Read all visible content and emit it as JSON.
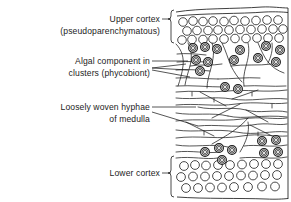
{
  "figure": {
    "background_color": "#ffffff",
    "ink_color": "#1d1d1d",
    "width": 291,
    "height": 202
  },
  "labels": [
    {
      "id": "upper-cortex",
      "line1": "Upper cortex",
      "line2": "(pseudoparenchymatous)",
      "anchor": "end",
      "x": 160,
      "y1": 22,
      "y2": 34,
      "marker": "bracket"
    },
    {
      "id": "algal-component",
      "line1": "Algal component in",
      "line2": "clusters (phycobiont)",
      "anchor": "end",
      "x": 150,
      "y1": 64,
      "y2": 76,
      "marker": "leader-fan"
    },
    {
      "id": "medulla-hyphae",
      "line1": "Loosely woven hyphae",
      "line2": "of medulla",
      "anchor": "end",
      "x": 150,
      "y1": 110,
      "y2": 122,
      "marker": "leader-pair"
    },
    {
      "id": "lower-cortex",
      "line1": "Lower cortex",
      "line2": "",
      "anchor": "end",
      "x": 160,
      "y1": 176,
      "y2": 0,
      "marker": "bracket"
    }
  ],
  "brackets": [
    {
      "id": "upper-cortex-bracket",
      "x": 171,
      "y_top": 10,
      "y_bottom": 43,
      "tick_x": 162,
      "tick_y": 26
    },
    {
      "id": "lower-cortex-bracket",
      "x": 171,
      "y_top": 156,
      "y_bottom": 197,
      "tick_x": 162,
      "tick_y": 176
    }
  ],
  "layers": [
    {
      "id": "upper-cortex-layer",
      "name": "Upper cortex",
      "structure": "pseudoparenchymatous",
      "cell_shape": "circle",
      "rows": 3,
      "cells_per_row": [
        10,
        9,
        10
      ],
      "y_start": 18,
      "row_spacing": 9.5,
      "cell_radius": 4.3,
      "x_start": 180,
      "x_spacing": 10.2
    },
    {
      "id": "algal-layer",
      "name": "Algal component in clusters (phycobiont)",
      "cell_shape": "concentric-circle",
      "cell_count": 16,
      "cell_radius": 4.4
    },
    {
      "id": "medulla-layer",
      "name": "Loosely woven hyphae of medulla",
      "structure": "loosely woven hyphae",
      "strand_count": 26
    },
    {
      "id": "lower-cortex-layer",
      "name": "Lower cortex",
      "cell_shape": "circle",
      "rows": 3,
      "cells_per_row": [
        9,
        9,
        8
      ],
      "y_start": 164,
      "row_spacing": 10.5,
      "cell_radius": 4.4,
      "x_start": 181,
      "x_spacing": 11.0
    }
  ],
  "algal_cells": [
    {
      "cx": 193,
      "cy": 48
    },
    {
      "cx": 205,
      "cy": 47
    },
    {
      "cx": 217,
      "cy": 49
    },
    {
      "cx": 240,
      "cy": 50
    },
    {
      "cx": 266,
      "cy": 46
    },
    {
      "cx": 280,
      "cy": 50
    },
    {
      "cx": 196,
      "cy": 60
    },
    {
      "cx": 208,
      "cy": 62
    },
    {
      "cx": 234,
      "cy": 60
    },
    {
      "cx": 258,
      "cy": 58
    },
    {
      "cx": 276,
      "cy": 62
    },
    {
      "cx": 200,
      "cy": 71
    },
    {
      "cx": 225,
      "cy": 87
    },
    {
      "cx": 238,
      "cy": 89
    },
    {
      "cx": 205,
      "cy": 152
    },
    {
      "cx": 219,
      "cy": 148
    },
    {
      "cx": 232,
      "cy": 150
    },
    {
      "cx": 222,
      "cy": 160
    },
    {
      "cx": 262,
      "cy": 141
    },
    {
      "cx": 276,
      "cy": 140
    },
    {
      "cx": 264,
      "cy": 153
    },
    {
      "cx": 278,
      "cy": 152
    }
  ]
}
